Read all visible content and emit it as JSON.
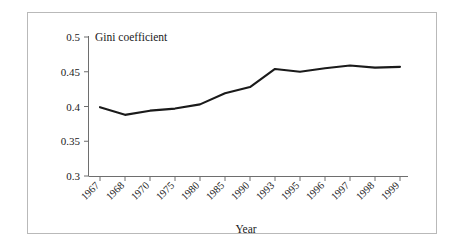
{
  "chart_data": {
    "type": "line",
    "title": "Gini coefficient",
    "xlabel": "Year",
    "ylabel": "",
    "categories": [
      "1967",
      "1968",
      "1970",
      "1975",
      "1980",
      "1985",
      "1990",
      "1993",
      "1995",
      "1996",
      "1997",
      "1998",
      "1999"
    ],
    "values": [
      0.399,
      0.388,
      0.394,
      0.397,
      0.403,
      0.419,
      0.428,
      0.454,
      0.45,
      0.455,
      0.459,
      0.456,
      0.457
    ],
    "series": [
      {
        "name": "Gini coefficient",
        "values": [
          0.399,
          0.388,
          0.394,
          0.397,
          0.403,
          0.419,
          0.428,
          0.454,
          0.45,
          0.455,
          0.459,
          0.456,
          0.457
        ]
      }
    ],
    "ylim": [
      0.3,
      0.5
    ],
    "ytick_labels": [
      "0.5",
      "0.45",
      "0.4",
      "0.35",
      "0.3"
    ],
    "ytick_values": [
      0.5,
      0.45,
      0.4,
      0.35,
      0.3
    ],
    "grid": false,
    "legend": false,
    "line_color": "#1a1a1a",
    "axis_color": "#6e6e6e",
    "background": "#ffffff",
    "xtick_label_rotation": "-45"
  }
}
